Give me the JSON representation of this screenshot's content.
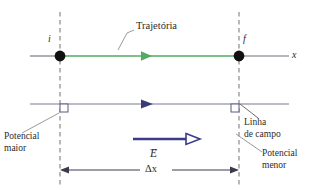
{
  "figure": {
    "type": "physics-diagram",
    "background_color": "#ffffff",
    "width": 319,
    "height": 190
  },
  "colors": {
    "trajectory_green": "#55aa63",
    "field_line_gray_purple": "#7a7a92",
    "field_arrow_navy": "#3a3a78",
    "e_vector_navy": "#3b3b86",
    "axis_gray": "#6e6e7a",
    "dashed_gray": "#8a8a8a",
    "leader_gray": "#9a9a9a",
    "dot_black": "#111111",
    "text_gray": "#2b2b2b"
  },
  "labels": {
    "initial_point": "i",
    "final_point": "f",
    "axis_x": "x",
    "trajectory": "Trajetória",
    "field_line_line1": "Linha",
    "field_line_line2": "de campo",
    "potential_higher_line1": "Potencial",
    "potential_higher_line2": "maior",
    "potential_lower_line1": "Potencial",
    "potential_lower_line2": "menor",
    "e_field_vector": "E",
    "displacement": "Δx"
  },
  "geometry": {
    "left_dashed_x": 60,
    "right_dashed_x": 239,
    "trajectory_y": 56,
    "field_line_y": 104,
    "e_vector_y": 139,
    "dimension_y": 170
  }
}
